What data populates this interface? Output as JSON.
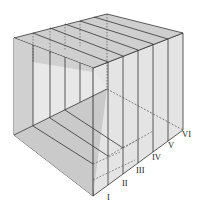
{
  "diagram": {
    "type": "cube-sections",
    "labels": [
      "I",
      "II",
      "III",
      "IV",
      "V",
      "VI"
    ],
    "colors": {
      "stroke": "#333333",
      "face_light": "#e6e6e6",
      "face_mid": "#d2d2d2",
      "face_dark": "#bdbdbd"
    }
  }
}
